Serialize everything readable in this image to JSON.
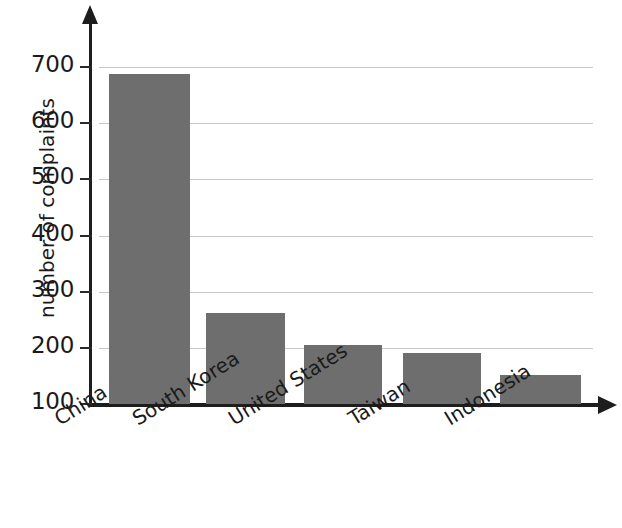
{
  "chart_data": {
    "type": "bar",
    "title": "",
    "subtitle": "",
    "xlabel": "",
    "ylabel": "number of complaints",
    "categories": [
      "China",
      "South Korea",
      "United States",
      "Taiwan",
      "Indonesia"
    ],
    "values": [
      688,
      262,
      205,
      191,
      152
    ],
    "ylim": [
      100,
      700
    ],
    "yticks": [
      100,
      200,
      300,
      400,
      500,
      600,
      700
    ],
    "ytick_labels": [
      "100",
      "200",
      "300",
      "400",
      "500",
      "600",
      "700"
    ],
    "grid": true,
    "legend": false,
    "legend_position": "none",
    "bar_color": "#6e6e6e",
    "axis_color": "#1d1d1d",
    "gridline_color": "#c9c9c9",
    "series": [
      {
        "name": "number of complaints",
        "values": [
          688,
          262,
          205,
          191,
          152
        ]
      }
    ]
  },
  "axis": {
    "y_title": "number of complaints"
  }
}
